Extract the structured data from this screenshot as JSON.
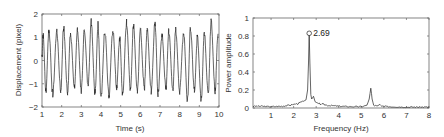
{
  "chart_data": [
    {
      "type": "line",
      "title": "",
      "xlabel": "Time (s)",
      "ylabel": "Displacement (pixel)",
      "xlim": [
        1,
        10
      ],
      "ylim": [
        -2,
        2
      ],
      "xticks": [
        "1",
        "2",
        "3",
        "4",
        "5",
        "6",
        "7",
        "8",
        "9",
        "10"
      ],
      "yticks": [
        "-2",
        "-1",
        "0",
        "1",
        "2"
      ],
      "grid": false,
      "dominant_frequency_hz": 2.69,
      "amplitude_approx": 1.2,
      "series": [
        {
          "name": "displacement",
          "description": "Quasi-sinusoidal oscillation at ~2.69 Hz, peaks ~+1.0 to +1.7, troughs ~-1.0 to -1.7",
          "peaks": [
            {
              "t": 1.05,
              "y": 1.1
            },
            {
              "t": 1.35,
              "y": 1.3
            },
            {
              "t": 1.75,
              "y": 1.3
            },
            {
              "t": 2.1,
              "y": 1.4
            },
            {
              "t": 2.45,
              "y": 1.2
            },
            {
              "t": 2.8,
              "y": 1.3
            },
            {
              "t": 3.15,
              "y": 1.2
            },
            {
              "t": 3.5,
              "y": 1.65
            },
            {
              "t": 3.85,
              "y": 1.55
            },
            {
              "t": 4.2,
              "y": 1.3
            },
            {
              "t": 4.6,
              "y": 1.3
            },
            {
              "t": 4.95,
              "y": 1.0
            },
            {
              "t": 5.3,
              "y": 1.65
            },
            {
              "t": 5.65,
              "y": 1.5
            },
            {
              "t": 6.0,
              "y": 1.3
            },
            {
              "t": 6.35,
              "y": 1.3
            },
            {
              "t": 6.75,
              "y": 1.6
            },
            {
              "t": 7.1,
              "y": 1.1
            },
            {
              "t": 7.45,
              "y": 1.3
            },
            {
              "t": 7.8,
              "y": 1.3
            },
            {
              "t": 8.2,
              "y": 1.2
            },
            {
              "t": 8.55,
              "y": 1.4
            },
            {
              "t": 8.9,
              "y": 1.0
            },
            {
              "t": 9.25,
              "y": 1.2
            },
            {
              "t": 9.6,
              "y": 1.65
            },
            {
              "t": 9.95,
              "y": 1.2
            }
          ],
          "troughs": [
            {
              "t": 1.2,
              "y": -1.3
            },
            {
              "t": 1.55,
              "y": -1.45
            },
            {
              "t": 1.95,
              "y": -1.3
            },
            {
              "t": 2.3,
              "y": -1.4
            },
            {
              "t": 2.65,
              "y": -1.2
            },
            {
              "t": 3.0,
              "y": -1.3
            },
            {
              "t": 3.35,
              "y": -1.0
            },
            {
              "t": 3.7,
              "y": -1.4
            },
            {
              "t": 4.0,
              "y": -1.6
            },
            {
              "t": 4.4,
              "y": -1.5
            },
            {
              "t": 4.8,
              "y": -1.1
            },
            {
              "t": 5.1,
              "y": -1.5
            },
            {
              "t": 5.5,
              "y": -1.2
            },
            {
              "t": 5.85,
              "y": -1.4
            },
            {
              "t": 6.2,
              "y": -1.2
            },
            {
              "t": 6.55,
              "y": -1.3
            },
            {
              "t": 6.9,
              "y": -1.4
            },
            {
              "t": 7.3,
              "y": -1.2
            },
            {
              "t": 7.65,
              "y": -1.2
            },
            {
              "t": 8.0,
              "y": -1.3
            },
            {
              "t": 8.4,
              "y": -1.75
            },
            {
              "t": 8.75,
              "y": -1.3
            },
            {
              "t": 9.1,
              "y": -1.7
            },
            {
              "t": 9.45,
              "y": -1.4
            },
            {
              "t": 9.8,
              "y": -1.3
            }
          ]
        }
      ]
    },
    {
      "type": "line",
      "title": "",
      "xlabel": "Frequency (Hz)",
      "ylabel": "Power amplitude",
      "xlim": [
        0.2,
        8
      ],
      "ylim": [
        0,
        1
      ],
      "xticks": [
        "1",
        "2",
        "3",
        "4",
        "5",
        "6",
        "7",
        "8"
      ],
      "yticks": [
        "0",
        "0.2",
        "0.4",
        "0.6",
        "0.8",
        "1"
      ],
      "grid": false,
      "annotations": [
        {
          "x": 2.69,
          "y": 0.83,
          "text": "2.69",
          "marker": "circle"
        }
      ],
      "series": [
        {
          "name": "power spectrum",
          "x": [
            0.2,
            0.5,
            1.0,
            1.5,
            1.8,
            2.0,
            2.2,
            2.4,
            2.55,
            2.62,
            2.66,
            2.69,
            2.72,
            2.76,
            2.8,
            2.88,
            2.95,
            3.1,
            3.5,
            4.0,
            4.5,
            5.0,
            5.25,
            5.35,
            5.42,
            5.48,
            5.55,
            5.7,
            5.82,
            5.9,
            6.2,
            7.0,
            8.0
          ],
          "values": [
            0.02,
            0.02,
            0.015,
            0.02,
            0.03,
            0.04,
            0.05,
            0.07,
            0.09,
            0.2,
            0.5,
            0.83,
            0.5,
            0.15,
            0.1,
            0.13,
            0.07,
            0.05,
            0.03,
            0.02,
            0.015,
            0.015,
            0.03,
            0.1,
            0.22,
            0.1,
            0.03,
            0.02,
            0.04,
            0.02,
            0.015,
            0.01,
            0.01
          ]
        }
      ]
    }
  ],
  "left_plot": {
    "xlabel": "Time (s)",
    "ylabel": "Displacement (pixel)",
    "xticks": [
      "1",
      "2",
      "3",
      "4",
      "5",
      "6",
      "7",
      "8",
      "9",
      "10"
    ],
    "yticks": [
      "2",
      "1",
      "0",
      "−1",
      "−2"
    ]
  },
  "right_plot": {
    "xlabel": "Frequency (Hz)",
    "ylabel": "Power amplitude",
    "xticks": [
      "1",
      "2",
      "3",
      "4",
      "5",
      "6",
      "7",
      "8"
    ],
    "yticks": [
      "1",
      "0.8",
      "0.6",
      "0.4",
      "0.2",
      "0"
    ],
    "peak_label": "2.69"
  }
}
